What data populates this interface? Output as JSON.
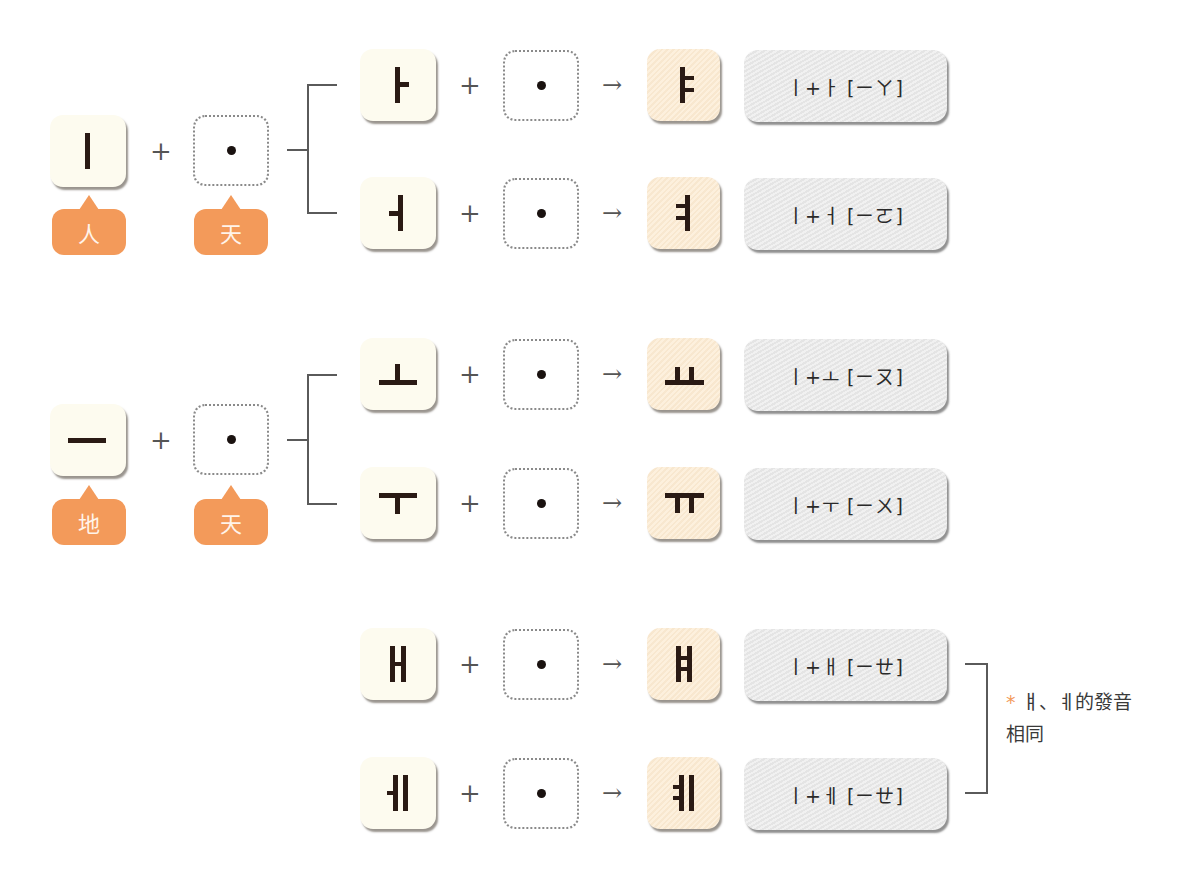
{
  "diagram": {
    "groups": [
      {
        "base": {
          "glyph": "ㅣ",
          "name": "i"
        },
        "dot_label": "天",
        "base_label": "人",
        "rows": [
          {
            "vowel": "ㅏ",
            "vowel_name": "a",
            "result": "ㅑ",
            "result_name": "ya",
            "formula": "ㅣ+ㅏ [ㄧㄚ]"
          },
          {
            "vowel": "ㅓ",
            "vowel_name": "eo",
            "result": "ㅕ",
            "result_name": "yeo",
            "formula": "ㅣ+ㅓ [ㄧㄛ]"
          }
        ]
      },
      {
        "base": {
          "glyph": "ㅡ",
          "name": "eu"
        },
        "dot_label": "天",
        "base_label": "地",
        "rows": [
          {
            "vowel": "ㅗ",
            "vowel_name": "o",
            "result": "ㅛ",
            "result_name": "yo",
            "formula": "ㅣ+ㅗ [ㄧㄡ]"
          },
          {
            "vowel": "ㅜ",
            "vowel_name": "u",
            "result": "ㅠ",
            "result_name": "yu",
            "formula": "ㅣ+ㅜ [ㄧㄨ]"
          }
        ]
      },
      {
        "rows": [
          {
            "vowel": "ㅐ",
            "vowel_name": "ae",
            "result": "ㅒ",
            "result_name": "yae",
            "formula": "ㅣ+ㅐ [ㄧㄝ]"
          },
          {
            "vowel": "ㅔ",
            "vowel_name": "e",
            "result": "ㅖ",
            "result_name": "ye",
            "formula": "ㅣ+ㅔ [ㄧㄝ]"
          }
        ]
      }
    ],
    "operators": {
      "plus": "+",
      "arrow": "→",
      "dot": "•"
    },
    "note": {
      "star": "*",
      "line1": "ㅒ、ㅖ的發音",
      "line2": "相同"
    }
  }
}
